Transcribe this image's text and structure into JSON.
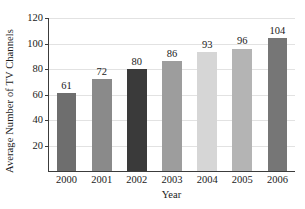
{
  "chart_data": {
    "type": "bar",
    "title": "",
    "xlabel": "Year",
    "ylabel": "Average Number of TV Channels",
    "categories": [
      "2000",
      "2001",
      "2002",
      "2003",
      "2004",
      "2005",
      "2006"
    ],
    "values": [
      61,
      72,
      80,
      86,
      93,
      96,
      104
    ],
    "value_labels": [
      "61",
      "72",
      "80",
      "86",
      "93",
      "96",
      "104"
    ],
    "bar_colors": [
      "#6e6e6e",
      "#8a8a8a",
      "#3a3a3a",
      "#9d9d9d",
      "#d6d6d6",
      "#b4b4b4",
      "#767676"
    ],
    "ylim": [
      0,
      120
    ],
    "yticks": [
      20,
      40,
      60,
      80,
      100,
      120
    ],
    "ytick_labels": [
      "20",
      "40",
      "60",
      "80",
      "100",
      "120"
    ],
    "grid": true,
    "grid_color": "#e2e2e2",
    "legend": null,
    "axis_color": "#3c3c3c",
    "background": "#ffffff"
  }
}
